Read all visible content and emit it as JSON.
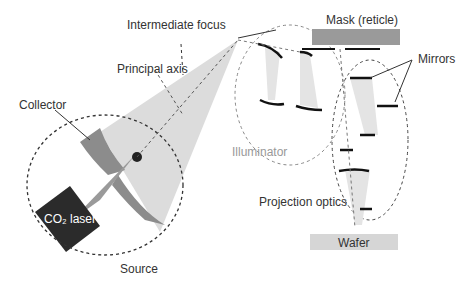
{
  "labels": {
    "intermediate_focus": "Intermediate focus",
    "principal_axis": "Principal axis",
    "collector": "Collector",
    "co2_laser": "CO₂ laser",
    "source": "Source",
    "illuminator": "Illuminator",
    "mask": "Mask (reticle)",
    "mirrors": "Mirrors",
    "projection_optics": "Projection optics",
    "wafer": "Wafer"
  },
  "colors": {
    "beam": "#d9d9d9",
    "collector": "#8c8c8c",
    "laser_box": "#2b2b2b",
    "wafer": "#d6d6d6",
    "mask": "#9a9a9a",
    "text": "#333333",
    "illuminator_text": "#999999"
  }
}
